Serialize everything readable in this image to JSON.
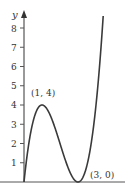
{
  "chart_data": {
    "type": "line",
    "title": "",
    "xlabel": "",
    "ylabel": "y",
    "function": "y = x^3 - 6x^2 + 9x",
    "y_ticks": [
      1,
      2,
      3,
      4,
      5,
      6,
      7,
      8
    ],
    "y_tick_labels": [
      "1",
      "2",
      "3",
      "4",
      "5",
      "6",
      "7",
      "8"
    ],
    "xlim": [
      0,
      5.6
    ],
    "ylim": [
      0,
      9
    ],
    "grid": false,
    "series": [
      {
        "name": "curve",
        "x": [
          0,
          0.25,
          0.5,
          0.75,
          1,
          1.25,
          1.5,
          1.75,
          2,
          2.25,
          2.5,
          2.75,
          3,
          3.25,
          3.5,
          3.75,
          4,
          4.2,
          4.4
        ],
        "y": [
          0,
          1.64,
          3.13,
          3.8,
          4,
          3.73,
          3.38,
          2.73,
          2,
          1.27,
          0.63,
          0.17,
          0,
          0.27,
          0.88,
          1.83,
          4,
          5.37,
          8.62
        ]
      }
    ],
    "annotations": [
      {
        "text": "(1, 4)",
        "x": 1,
        "y": 4
      },
      {
        "text": "(3, 0)",
        "x": 3,
        "y": 0
      }
    ]
  },
  "labels": {
    "y_axis": "y",
    "tick_1": "1",
    "tick_2": "2",
    "tick_3": "3",
    "tick_4": "4",
    "tick_5": "5",
    "tick_6": "6",
    "tick_7": "7",
    "tick_8": "8",
    "max_point": "(1, 4)",
    "min_point": "(3, 0)"
  }
}
